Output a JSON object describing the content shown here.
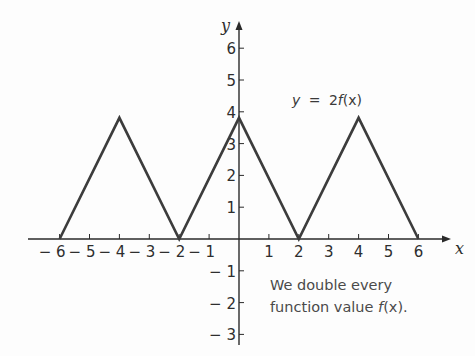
{
  "chart_data": {
    "type": "line",
    "title": "y = 2f(x)",
    "xlabel": "x",
    "ylabel": "y",
    "xlim": [
      -6.5,
      7
    ],
    "ylim": [
      -3.5,
      7
    ],
    "grid": false,
    "x_ticks": [
      -6,
      -5,
      -4,
      -3,
      -2,
      -1,
      1,
      2,
      3,
      4,
      5,
      6
    ],
    "y_ticks": [
      -3,
      -2,
      -1,
      1,
      2,
      3,
      4,
      5,
      6
    ],
    "series": [
      {
        "name": "y = 2f(x)",
        "x": [
          -6,
          -4,
          -2,
          0,
          2,
          4,
          6
        ],
        "y": [
          0,
          4,
          0,
          4,
          0,
          4,
          0
        ]
      }
    ],
    "annotations": [
      "y = 2f(x)",
      "We double every function value f(x)."
    ]
  },
  "labels": {
    "x_axis": "x",
    "y_axis": "y",
    "equation": {
      "lhs": "y",
      "eq": "=",
      "rhs_num": "2",
      "rhs_fn": "f",
      "rhs_arg": "(x)"
    },
    "note_line1": "We double every",
    "note_line2_prefix": "function value ",
    "note_line2_fn": "f",
    "note_line2_arg": "(x)",
    "note_line2_suffix": "."
  },
  "x_tick_labels": [
    "− 6",
    "− 5",
    "− 4",
    "− 3",
    "− 2",
    "− 1",
    "1",
    "2",
    "3",
    "4",
    "5",
    "6"
  ],
  "y_tick_labels": [
    "6",
    "5",
    "4",
    "3",
    "2",
    "1",
    "− 1",
    "− 2",
    "− 3"
  ],
  "colors": {
    "axis": "#2a2a2a",
    "curve": "#3c3c3c",
    "text": "#2e2e2e"
  }
}
